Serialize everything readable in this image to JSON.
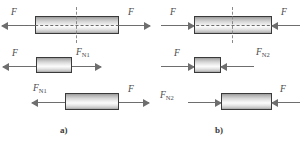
{
  "figure": {
    "background_color": "#ffffff",
    "bar_outline_color": "#3a3a3a",
    "arrow_color": "#6e6e6e",
    "label_color": "#4a4a4a",
    "axis_color": "#6b6b6b"
  },
  "panels": [
    {
      "id": "a",
      "caption": "a)",
      "loading": "tension",
      "rows": [
        {
          "name": "full-bar-tension",
          "left_label": "F",
          "right_label": "F",
          "left_arrow_direction": "left",
          "right_arrow_direction": "right",
          "has_section_cut": true,
          "has_center_axis": true
        },
        {
          "name": "left-segment-tension",
          "left_label": "F",
          "right_label": "F",
          "right_label_sub": "N1",
          "left_arrow_direction": "left",
          "right_arrow_direction": "right",
          "has_section_cut": false,
          "has_center_axis": false
        },
        {
          "name": "right-segment-tension",
          "left_label": "F",
          "left_label_sub": "N1",
          "right_label": "F",
          "left_arrow_direction": "left",
          "right_arrow_direction": "right",
          "has_section_cut": false,
          "has_center_axis": false
        }
      ]
    },
    {
      "id": "b",
      "caption": "b)",
      "loading": "compression",
      "rows": [
        {
          "name": "full-bar-compression",
          "left_label": "F",
          "right_label": "F",
          "left_arrow_direction": "right",
          "right_arrow_direction": "left",
          "has_section_cut": true,
          "has_center_axis": true
        },
        {
          "name": "left-segment-compression",
          "left_label": "F",
          "right_label": "F",
          "right_label_sub": "N2",
          "left_arrow_direction": "right",
          "right_arrow_direction": "left",
          "has_section_cut": false,
          "has_center_axis": false
        },
        {
          "name": "right-segment-compression",
          "left_label": "F",
          "left_label_sub": "N2",
          "right_label": "F",
          "left_arrow_direction": "right",
          "right_arrow_direction": "left",
          "has_section_cut": false,
          "has_center_axis": false
        }
      ]
    }
  ],
  "labels": {
    "force": "F",
    "normal_force_1_sub": "N1",
    "normal_force_2_sub": "N2",
    "caption_a": "a)",
    "caption_b": "b)"
  }
}
